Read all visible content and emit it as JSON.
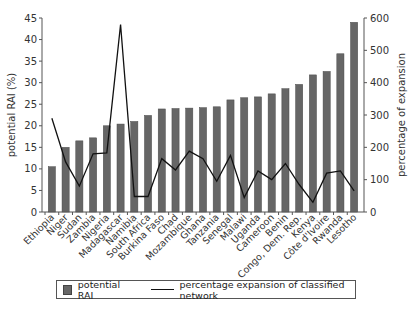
{
  "chart_data": {
    "type": "bar",
    "title": "",
    "xlabel": "",
    "ylabel": "potential RAI (%)",
    "y2label": "percentage of expansion",
    "ylim": [
      0,
      45
    ],
    "y2lim": [
      0,
      600
    ],
    "yticks": [
      0,
      5,
      10,
      15,
      20,
      25,
      30,
      35,
      40,
      45
    ],
    "y2ticks": [
      0,
      100,
      200,
      300,
      400,
      500,
      600
    ],
    "grid": false,
    "legend_position": "bottom",
    "categories": [
      "Ethiopia",
      "Niger",
      "Sudan",
      "Zambia",
      "Nigeria",
      "Madagascar",
      "Namibia",
      "South Africa",
      "Burkina Faso",
      "Chad",
      "Mozambique",
      "Ghana",
      "Tanzania",
      "Senegal",
      "Malawi",
      "Uganda",
      "Cameroon",
      "Benin",
      "Congo, Dem. Rep.",
      "Kenya",
      "Côte d'Ivoire",
      "Rwanda",
      "Lesotho"
    ],
    "series": [
      {
        "name": "potential RAI",
        "type": "bar",
        "axis": "left",
        "color": "#666666",
        "values": [
          10.5,
          15,
          16.5,
          17.2,
          20,
          20.4,
          21,
          22.4,
          23.9,
          24,
          24.1,
          24.2,
          24.4,
          26,
          26.5,
          26.7,
          27.4,
          28.6,
          29.6,
          31.8,
          32.6,
          36.7,
          44
        ]
      },
      {
        "name": "percentage expansion of classified network",
        "type": "line",
        "axis": "right",
        "color": "#111111",
        "values": [
          290,
          155,
          80,
          180,
          183,
          580,
          48,
          48,
          165,
          130,
          188,
          165,
          95,
          175,
          45,
          127,
          100,
          150,
          85,
          30,
          120,
          127,
          65
        ]
      }
    ]
  },
  "legend": {
    "bar_label": "potential RAI",
    "line_label": "percentage expansion of classified network"
  }
}
